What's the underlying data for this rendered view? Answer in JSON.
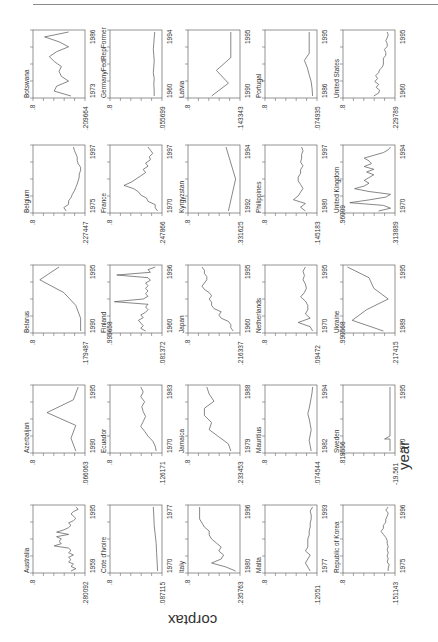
{
  "chart_data": {
    "type": "line",
    "layout": "5x5 small multiples, page rotated 90deg",
    "xlabel": "year",
    "ylabel": "corptax",
    "grid": false,
    "panels": [
      {
        "name": "Botswana",
        "ymax_label": ".8",
        "ymin_label": ".209664",
        "xstart": "1973",
        "xend": "1986",
        "series": [
          0.25,
          0.6,
          0.55,
          0.3,
          0.45,
          0.5,
          0.45,
          0.6,
          0.7,
          0.55,
          0.3,
          0.5,
          0.8,
          0.3
        ]
      },
      {
        "name": "GermanyFedRepFormer",
        "ymax_label": ".8",
        "ymin_label": ".055699",
        "xstart": "1960",
        "xend": "1994",
        "series": [
          0.12,
          0.12,
          0.13,
          0.12,
          0.14,
          0.13,
          0.12,
          0.13,
          0.14,
          0.13,
          0.12,
          0.11
        ]
      },
      {
        "name": "Latvia",
        "ymax_label": ".8",
        "ymin_label": ".143343",
        "xstart": "1990",
        "xend": "1995",
        "series": [
          0.55,
          0.2,
          0.45,
          0.15,
          0.15,
          0.15
        ]
      },
      {
        "name": "Portugal",
        "ymax_label": ".8",
        "ymin_label": ".074935",
        "xstart": "1986",
        "xend": "1995",
        "series": [
          0.05,
          0.06,
          0.08,
          0.12,
          0.16,
          0.22,
          0.12,
          0.12,
          0.12,
          0.12
        ]
      },
      {
        "name": "United States",
        "ymax_label": ".8",
        "ymin_label": ".229789",
        "xstart": "1960",
        "xend": "1995",
        "series": [
          0.4,
          0.3,
          0.28,
          0.35,
          0.3,
          0.38,
          0.32,
          0.36,
          0.3,
          0.28,
          0.22,
          0.2,
          0.2,
          0.2,
          0.15,
          0.15,
          0.18,
          0.12,
          0.12,
          0.15,
          0.12,
          0.1,
          0.12
        ]
      },
      {
        "name": "Belgium",
        "ymax_label": ".8",
        "ymin_label": ".227447",
        "xstart": "1975",
        "xend": "1997",
        "series": [
          0.35,
          0.4,
          0.3,
          0.3,
          0.25,
          0.22,
          0.18,
          0.15,
          0.12,
          0.1,
          0.08,
          0.08,
          0.05,
          0.05,
          0.1,
          0.12,
          0.12,
          0.15,
          0.18,
          0.2
        ]
      },
      {
        "name": "France",
        "ymax_label": ".8",
        "ymin_label": ".247866",
        "xstart": "1970",
        "xend": "1997",
        "series": [
          0.05,
          0.1,
          0.1,
          0.25,
          0.28,
          0.4,
          0.45,
          0.55,
          0.75,
          0.6,
          0.5,
          0.4,
          0.3,
          0.35,
          0.25,
          0.3,
          0.2,
          0.22,
          0.15,
          0.2,
          0.25
        ]
      },
      {
        "name": "Kyrgyzstan",
        "ymax_label": ".8",
        "ymin_label": ".331625",
        "xstart": "1992",
        "xend": "1994",
        "series": [
          0.2,
          0.05,
          0.25
        ]
      },
      {
        "name": "Philippines",
        "ymax_label": ".8",
        "ymin_label": ".145183",
        "xstart": "1980",
        "xend": "1997",
        "series": [
          0.2,
          0.3,
          0.2,
          0.45,
          0.35,
          0.3,
          0.25,
          0.3,
          0.35,
          0.35,
          0.3,
          0.3,
          0.25,
          0.3,
          0.28,
          0.28,
          0.25,
          0.28
        ]
      },
      {
        "name": "United Kingdom",
        "ymax_label": ".96009",
        "ymin_label": ".313889",
        "xstart": "1970",
        "xend": "1994",
        "series": [
          0.3,
          0.05,
          0.2,
          0.9,
          0.5,
          0.15,
          0.05,
          0.5,
          0.8,
          0.6,
          0.5,
          0.6,
          0.5,
          0.4,
          0.55,
          0.4,
          0.6,
          0.45,
          0.5,
          0.6,
          0.4,
          0.2,
          0.1,
          0.05
        ]
      },
      {
        "name": "Belarus",
        "ymax_label": ".8",
        "ymin_label": ".179487",
        "xstart": "1990",
        "xend": "1995",
        "series": [
          0.05,
          0.05,
          0.15,
          0.4,
          0.9,
          0.5
        ]
      },
      {
        "name": "Finland",
        "ymax_label": ".995658",
        "ymin_label": ".081372",
        "xstart": "1960",
        "xend": "1996",
        "series": [
          0.3,
          0.4,
          0.35,
          0.4,
          0.45,
          0.35,
          0.4,
          0.3,
          0.25,
          0.3,
          0.25,
          0.95,
          0.35,
          0.25,
          0.3,
          0.25,
          0.3,
          0.25,
          0.3,
          0.2,
          0.25,
          0.9,
          0.2,
          0.25,
          0.1
        ]
      },
      {
        "name": "Japan",
        "ymax_label": ".8",
        "ymin_label": ".216337",
        "xstart": "1960",
        "xend": "1995",
        "series": [
          0.1,
          0.15,
          0.15,
          0.2,
          0.35,
          0.4,
          0.35,
          0.5,
          0.55,
          0.55,
          0.6,
          0.55,
          0.6,
          0.7,
          0.75,
          0.7,
          0.65,
          0.65,
          0.7,
          0.7,
          0.75
        ]
      },
      {
        "name": "Netherlands",
        "ymax_label": ".8",
        "ymin_label": ".09472",
        "xstart": "1970",
        "xend": "1995",
        "series": [
          0.05,
          0.1,
          0.35,
          0.1,
          0.2,
          0.15,
          0.15,
          0.2,
          0.3,
          0.22,
          0.18,
          0.2,
          0.25,
          0.22,
          0.25,
          0.2
        ]
      },
      {
        "name": "Ukraine",
        "ymax_label": ".990568",
        "ymin_label": ".217415",
        "xstart": "1989",
        "xend": "1995",
        "series": [
          0.2,
          0.85,
          0.55,
          0.1,
          0.4,
          0.5,
          0.95
        ]
      },
      {
        "name": "Azerbaijan",
        "ymax_label": ".8",
        "ymin_label": ".066063",
        "xstart": "1990",
        "xend": "1995",
        "series": [
          0.15,
          0.25,
          0.15,
          0.75,
          0.2,
          0.1
        ]
      },
      {
        "name": "Ecuador",
        "ymax_label": ".8",
        "ymin_label": ".126171",
        "xstart": "1970",
        "xend": "1983",
        "series": [
          0.08,
          0.1,
          0.15,
          0.25,
          0.32,
          0.4,
          0.35,
          0.3,
          0.35,
          0.38,
          0.32,
          0.4,
          0.35,
          0.4
        ]
      },
      {
        "name": "Jamaica",
        "ymax_label": ".8",
        "ymin_label": ".233453",
        "xstart": "1979",
        "xend": "1988",
        "series": [
          0.15,
          0.2,
          0.4,
          0.6,
          0.55,
          0.7,
          0.7,
          0.5,
          0.6,
          0.65
        ]
      },
      {
        "name": "Mauritius",
        "ymax_label": ".8",
        "ymin_label": ".074544",
        "xstart": "1982",
        "xend": "1994",
        "series": [
          0.08,
          0.1,
          0.12,
          0.1,
          0.08,
          0.1,
          0.12,
          0.15,
          0.12,
          0.1,
          0.08,
          0.06,
          0.05
        ]
      },
      {
        "name": "Sweden",
        "ymax_label": ".819556",
        "ymin_label": "-19.561",
        "xstart": "1970",
        "xend": "1995",
        "series": [
          0.1,
          0.1,
          0.1,
          0.1,
          0.1,
          0.1,
          0.1,
          0.1,
          0.1,
          0.1,
          0.1,
          0.1,
          0.1,
          0.1,
          0.1,
          0.1,
          0.1,
          0.1,
          0.1,
          0.1,
          0.1,
          0.1,
          0.1,
          0.1,
          0.1,
          0.1
        ]
      },
      {
        "name": "Australia",
        "ymax_label": ".8",
        "ymin_label": ".280092",
        "xstart": "1959",
        "xend": "1995",
        "series": [
          0.25,
          0.15,
          0.25,
          0.2,
          0.3,
          0.25,
          0.3,
          0.2,
          0.3,
          0.25,
          0.3,
          0.6,
          0.45,
          0.5,
          0.45,
          0.55,
          0.3,
          0.55,
          0.4,
          0.3,
          0.25,
          0.3,
          0.2,
          0.15,
          0.2,
          0.25,
          0.2,
          0.1,
          0.15
        ]
      },
      {
        "name": "Cote d'Ivoire",
        "ymax_label": ".8",
        "ymin_label": ".087115",
        "xstart": "1970",
        "xend": "1977",
        "series": [
          0.05,
          0.06,
          0.07,
          0.08,
          0.1,
          0.12,
          0.13,
          0.14
        ]
      },
      {
        "name": "Italy",
        "ymax_label": ".8",
        "ymin_label": ".235763",
        "xstart": "1980",
        "xend": "1996",
        "series": [
          0.05,
          0.25,
          0.55,
          0.35,
          0.3,
          0.4,
          0.35,
          0.45,
          0.55,
          0.6,
          0.6,
          0.7,
          0.75,
          0.8,
          0.8,
          0.8,
          0.8
        ]
      },
      {
        "name": "Malta",
        "ymax_label": ".8",
        "ymin_label": ".12051",
        "xstart": "1977",
        "xend": "1993",
        "series": [
          0.1,
          0.15,
          0.2,
          0.15,
          0.1,
          0.2,
          0.15,
          0.15,
          0.15,
          0.12,
          0.12,
          0.1,
          0.1,
          0.08,
          0.08,
          0.1,
          0.05
        ]
      },
      {
        "name": "Republic of Korea",
        "ymax_label": ".8",
        "ymin_label": ".151143",
        "xstart": "1975",
        "xend": "1996",
        "series": [
          0.1,
          0.1,
          0.08,
          0.12,
          0.1,
          0.12,
          0.1,
          0.12,
          0.1,
          0.12,
          0.12,
          0.15,
          0.2,
          0.25,
          0.2,
          0.2,
          0.15,
          0.15,
          0.12,
          0.1,
          0.15,
          0.1
        ]
      }
    ]
  }
}
